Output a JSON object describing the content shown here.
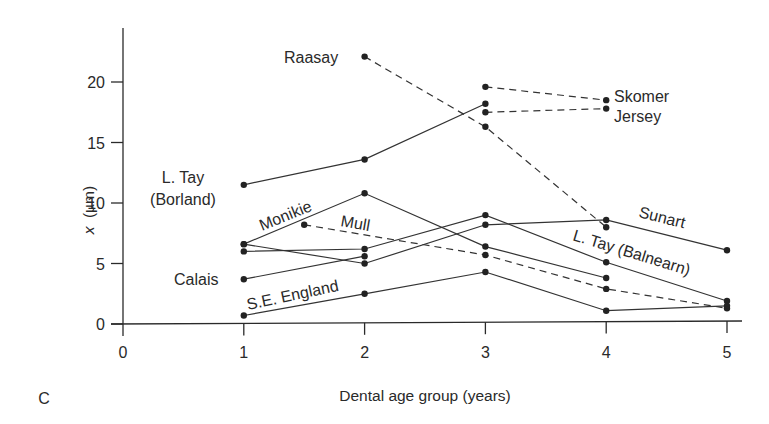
{
  "chart_data": {
    "type": "line",
    "panel_label": "C",
    "title": "",
    "xlabel": "Dental age group (years)",
    "ylabel": "x (µm)",
    "ylabel_var": "x",
    "ylabel_unit": "(µm)",
    "xlim": [
      0,
      5
    ],
    "ylim": [
      0,
      24
    ],
    "xticks": [
      0,
      1,
      2,
      3,
      4,
      5
    ],
    "yticks": [
      0,
      5,
      10,
      15,
      20
    ],
    "grid": false,
    "legend": "inline labels",
    "series": [
      {
        "name": "Raasay",
        "style": "dashed",
        "x": [
          2,
          3,
          4
        ],
        "values": [
          22.1,
          16.3,
          8.0
        ],
        "label": {
          "text": "Raasay",
          "x": 284,
          "y": 63,
          "rotate": 0
        }
      },
      {
        "name": "Skomer",
        "style": "dashed",
        "x": [
          3,
          4
        ],
        "values": [
          19.6,
          18.5
        ],
        "label": {
          "text": "Skomer",
          "x": 614,
          "y": 102,
          "rotate": 0
        }
      },
      {
        "name": "Jersey",
        "style": "dashed",
        "x": [
          3,
          4
        ],
        "values": [
          17.5,
          17.8
        ],
        "label": {
          "text": "Jersey",
          "x": 614,
          "y": 122,
          "rotate": 0
        }
      },
      {
        "name": "L. Tay (Borland)",
        "style": "solid",
        "x": [
          1,
          2,
          3
        ],
        "values": [
          11.5,
          13.6,
          18.2
        ],
        "label": {
          "text": "L. Tay",
          "text2": "(Borland)",
          "x": 183,
          "y": 183,
          "rotate": 0
        }
      },
      {
        "name": "Monikie",
        "style": "solid",
        "x": [
          1,
          2,
          3,
          4
        ],
        "values": [
          6.6,
          10.8,
          6.4,
          3.8
        ],
        "label": {
          "text": "Monikie",
          "x": 262,
          "y": 231,
          "rotate": -22
        }
      },
      {
        "name": "Mull",
        "style": "dashed",
        "x": [
          1.5,
          3,
          4,
          5
        ],
        "values": [
          8.2,
          5.7,
          2.9,
          1.3
        ],
        "label": {
          "text": "Mull",
          "x": 340,
          "y": 226,
          "rotate": 10
        }
      },
      {
        "name": "L. Tay (Balnearn)",
        "style": "solid",
        "x": [
          1,
          2,
          3,
          4,
          5
        ],
        "values": [
          6.0,
          6.2,
          9.0,
          5.1,
          1.9
        ],
        "label": {
          "text": "L. Tay (Balnearn)",
          "x": 572,
          "y": 240,
          "rotate": 17
        }
      },
      {
        "name": "Sunart",
        "style": "solid",
        "x": [
          1,
          2,
          3,
          4,
          5
        ],
        "values": [
          6.6,
          5.0,
          8.2,
          8.6,
          6.1
        ],
        "label": {
          "text": "Sunart",
          "x": 638,
          "y": 217,
          "rotate": 14
        }
      },
      {
        "name": "Calais",
        "style": "solid",
        "x": [
          1,
          2
        ],
        "values": [
          3.7,
          5.6
        ],
        "label": {
          "text": "Calais",
          "x": 174,
          "y": 285,
          "rotate": 0
        }
      },
      {
        "name": "S.E. England",
        "style": "solid",
        "x": [
          1,
          2,
          3,
          4,
          5
        ],
        "values": [
          0.7,
          2.5,
          4.3,
          1.1,
          1.5
        ],
        "label": {
          "text": "S.E. England",
          "x": 248,
          "y": 310,
          "rotate": -12
        }
      }
    ]
  },
  "layout": {
    "origin_x": 123,
    "origin_y": 324,
    "px_per_x": 120.8,
    "px_per_y": 12.1,
    "yaxis_top": 28,
    "xaxis_right": 742
  }
}
